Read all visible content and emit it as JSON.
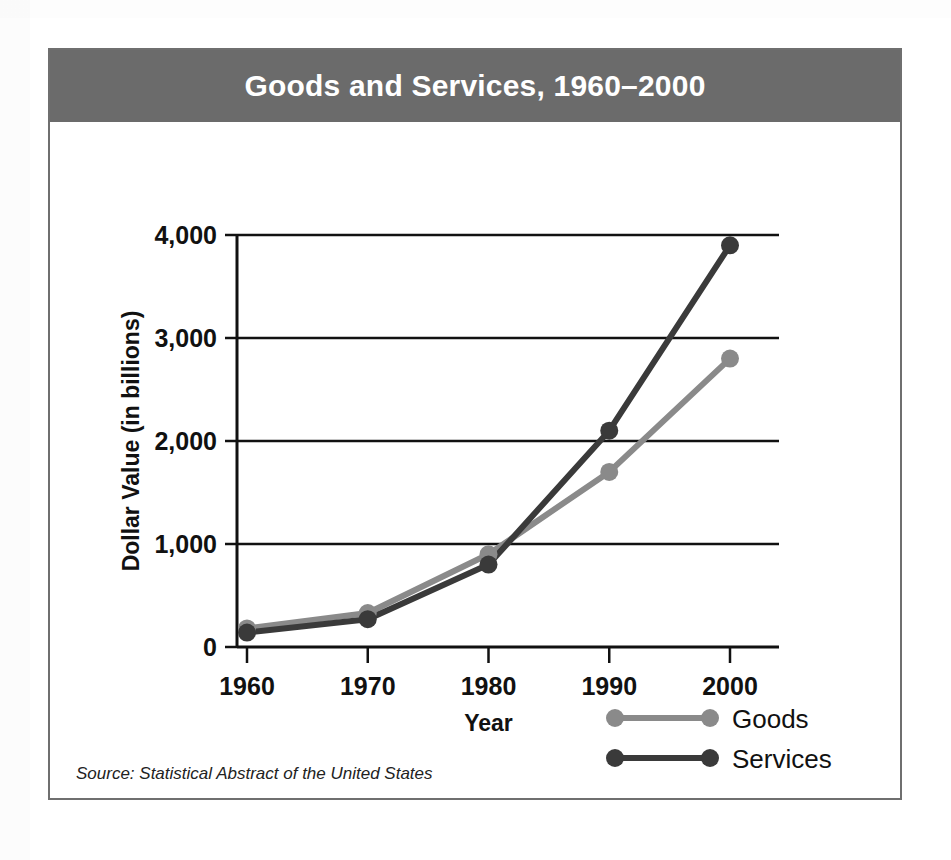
{
  "figure": {
    "title": "Goods and Services, 1960–2000",
    "source_note": "Source: Statistical Abstract of the United States",
    "banner_color": "#6b6b6b",
    "frame_color": "#6f6f6f"
  },
  "chart_data": {
    "type": "line",
    "title": "Goods and Services, 1960–2000",
    "xlabel": "Year",
    "ylabel": "Dollar Value (in billions)",
    "categories": [
      1960,
      1970,
      1980,
      1990,
      2000
    ],
    "xtick_labels": [
      "1960",
      "1970",
      "1980",
      "1990",
      "2000"
    ],
    "ytick_values": [
      0,
      1000,
      2000,
      3000,
      4000
    ],
    "ytick_labels": [
      "0",
      "1,000",
      "2,000",
      "3,000",
      "4,000"
    ],
    "ylim": [
      0,
      4000
    ],
    "xlim": [
      1960,
      2000
    ],
    "grid": true,
    "legend_position": "bottom-right",
    "series": [
      {
        "name": "Goods",
        "color": "#8a8a8a",
        "values": [
          180,
          330,
          900,
          1700,
          2800
        ]
      },
      {
        "name": "Services",
        "color": "#3a3a3a",
        "values": [
          140,
          270,
          800,
          2100,
          3900
        ]
      }
    ]
  }
}
